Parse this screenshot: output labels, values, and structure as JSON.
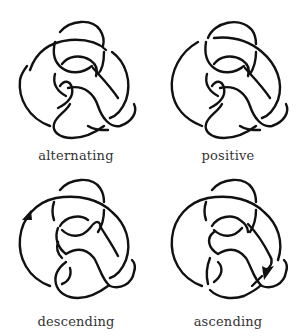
{
  "figure": {
    "type": "knot-diagram-grid",
    "panels": [
      {
        "id": "alternating",
        "label": "alternating",
        "arrow": null
      },
      {
        "id": "positive",
        "label": "positive",
        "arrow": null
      },
      {
        "id": "descending",
        "label": "descending",
        "arrow": {
          "position": "left-outer-arc",
          "direction": "up-right"
        }
      },
      {
        "id": "ascending",
        "label": "ascending",
        "arrow": {
          "position": "lower-right",
          "direction": "down-left"
        }
      }
    ],
    "colors": {
      "stroke": "#111111",
      "label": "#333333",
      "background": "#ffffff"
    }
  }
}
